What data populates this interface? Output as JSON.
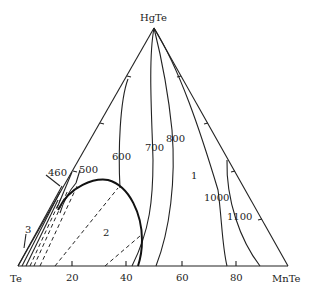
{
  "diagram": {
    "type": "ternary-phase-diagram",
    "vertices": {
      "top": "HgTe",
      "bottom_left": "Te",
      "bottom_right": "MnTe"
    },
    "base_ticks": [
      "20",
      "40",
      "60",
      "80"
    ],
    "isotherm_labels": [
      "460",
      "500",
      "600",
      "700",
      "800",
      "1000",
      "1100"
    ],
    "region_labels": [
      "1",
      "2",
      "3"
    ]
  }
}
